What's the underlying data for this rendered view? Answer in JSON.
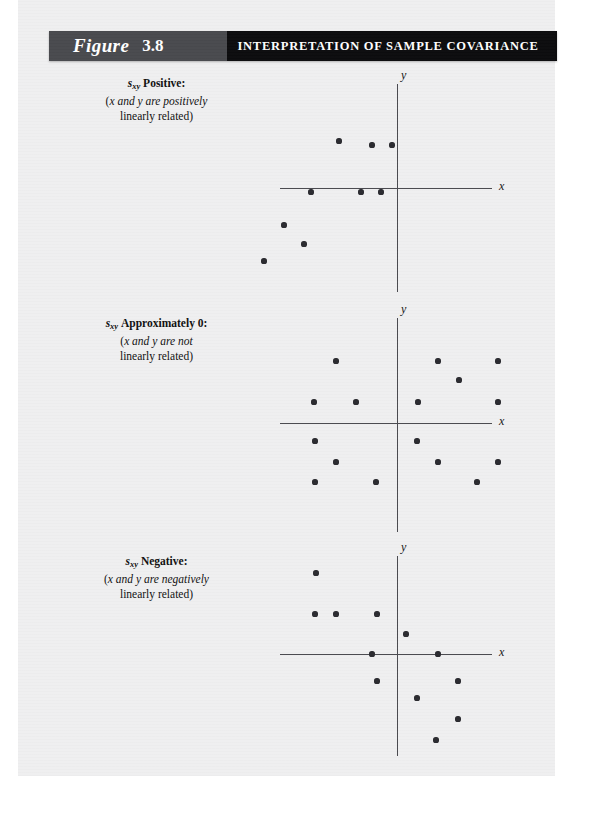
{
  "header": {
    "figure_word": "Figure",
    "figure_number": "3.8",
    "title": "INTERPRETATION OF SAMPLE COVARIANCE",
    "label_box_color": "#494a4e",
    "title_box_color": "#0c0c0e",
    "text_color": "#ffffff"
  },
  "page": {
    "background_color": "#efeff0",
    "ink_color": "#2b2b30"
  },
  "panels": [
    {
      "caption": {
        "symbol": "s",
        "subscript": "xy",
        "status": "Positive:",
        "line2_prefix": "(",
        "line2": "x and y are positively",
        "line3": "linearly related)"
      },
      "axis": {
        "x_label": "x",
        "y_label": "y"
      }
    },
    {
      "caption": {
        "symbol": "s",
        "subscript": "xy",
        "status": "Approximately 0:",
        "line2_prefix": "(",
        "line2": "x and y are not",
        "line3": "linearly related)"
      },
      "axis": {
        "x_label": "x",
        "y_label": "y"
      }
    },
    {
      "caption": {
        "symbol": "s",
        "subscript": "xy",
        "status": "Negative:",
        "line2_prefix": "(",
        "line2": "x and y are negatively",
        "line3": "linearly related)"
      },
      "axis": {
        "x_label": "x",
        "y_label": "y"
      }
    }
  ],
  "chart_data": [
    {
      "type": "scatter",
      "title": "s_xy Positive",
      "subtitle": "(x and y are positively linearly related)",
      "xlabel": "x",
      "ylabel": "y",
      "xlim": [
        -10,
        10
      ],
      "ylim": [
        -10,
        10
      ],
      "grid": false,
      "legend": false,
      "origin_px": [
        123,
        118
      ],
      "axis_h_px": {
        "x1": 6,
        "x2": 218,
        "y": 118
      },
      "axis_v_px": {
        "y1": 14,
        "y2": 222,
        "x": 123
      },
      "points": [
        [
          -58,
          47
        ],
        [
          -25,
          43
        ],
        [
          -5,
          43
        ],
        [
          -86,
          -4
        ],
        [
          -36,
          -4
        ],
        [
          -16,
          -4
        ],
        [
          -113,
          -37
        ],
        [
          -93,
          -56
        ],
        [
          -133,
          -73
        ]
      ],
      "points_note": "pixel offsets from origin; y positive is up"
    },
    {
      "type": "scatter",
      "title": "s_xy Approximately 0",
      "subtitle": "(x and y are not linearly related)",
      "xlabel": "x",
      "ylabel": "y",
      "xlim": [
        -10,
        10
      ],
      "ylim": [
        -10,
        10
      ],
      "grid": false,
      "legend": false,
      "origin_px": [
        123,
        113
      ],
      "axis_h_px": {
        "x1": 6,
        "x2": 218,
        "y": 113
      },
      "axis_v_px": {
        "y1": 8,
        "y2": 222,
        "x": 123
      },
      "points": [
        [
          -61,
          62
        ],
        [
          41,
          62
        ],
        [
          101,
          62
        ],
        [
          62,
          43
        ],
        [
          -83,
          21
        ],
        [
          -41,
          21
        ],
        [
          21,
          21
        ],
        [
          101,
          21
        ],
        [
          -82,
          -18
        ],
        [
          20,
          -18
        ],
        [
          -61,
          -39
        ],
        [
          41,
          -39
        ],
        [
          101,
          -39
        ],
        [
          -82,
          -59
        ],
        [
          -21,
          -59
        ],
        [
          80,
          -59
        ]
      ],
      "points_note": "pixel offsets from origin; y positive is up"
    },
    {
      "type": "scatter",
      "title": "s_xy Negative",
      "subtitle": "(x and y are negatively linearly related)",
      "xlabel": "x",
      "ylabel": "y",
      "xlim": [
        -10,
        10
      ],
      "ylim": [
        -10,
        10
      ],
      "grid": false,
      "legend": false,
      "origin_px": [
        123,
        106
      ],
      "axis_h_px": {
        "x1": 6,
        "x2": 218,
        "y": 106
      },
      "axis_v_px": {
        "y1": 8,
        "y2": 208,
        "x": 123
      },
      "points": [
        [
          -81,
          81
        ],
        [
          -82,
          40
        ],
        [
          -61,
          40
        ],
        [
          -20,
          40
        ],
        [
          9,
          20
        ],
        [
          -25,
          0
        ],
        [
          41,
          0
        ],
        [
          -20,
          -27
        ],
        [
          61,
          -27
        ],
        [
          20,
          -44
        ],
        [
          61,
          -65
        ],
        [
          39,
          -86
        ]
      ],
      "points_note": "pixel offsets from origin; y positive is up"
    }
  ]
}
